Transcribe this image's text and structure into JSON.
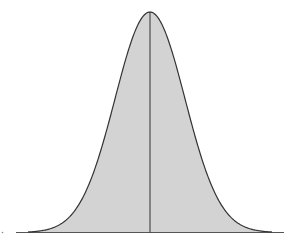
{
  "chart_data": {
    "type": "area",
    "title": "",
    "xlabel": "",
    "ylabel": "",
    "distribution": {
      "name": "normal",
      "mean": 0,
      "sd": 1
    },
    "x_range": [
      -4,
      4
    ],
    "mean_line": 0,
    "grid": false,
    "legend": null,
    "x": [
      -4,
      -3,
      -2,
      -1,
      0,
      1,
      2,
      3,
      4
    ],
    "values": [
      0.0001,
      0.0044,
      0.054,
      0.242,
      0.399,
      0.242,
      0.054,
      0.0044,
      0.0001
    ],
    "colors": {
      "fill": "#d3d3d3",
      "stroke": "#333333",
      "axis": "#555555"
    }
  }
}
